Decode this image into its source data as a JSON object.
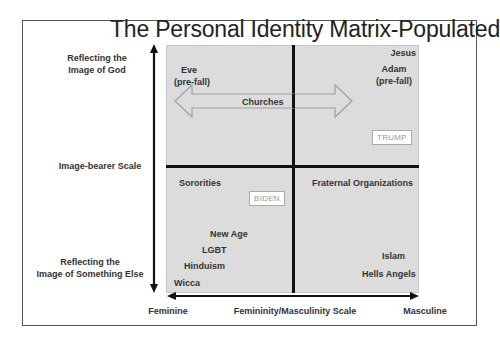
{
  "title": "The Personal Identity Matrix-Populated",
  "y_axis": {
    "top_label_line1": "Reflecting the",
    "top_label_line2": "Image of God",
    "middle_label": "Image-bearer Scale",
    "bottom_label_line1": "Reflecting the",
    "bottom_label_line2": "Image of Something Else"
  },
  "x_axis": {
    "left_label": "Feminine",
    "middle_label": "Femininity/Masculinity Scale",
    "right_label": "Masculine"
  },
  "quadrants": {
    "top_left": {
      "items": [
        {
          "line1": "Eve",
          "line2": "(pre-fall)"
        }
      ]
    },
    "top_right": {
      "items": [
        {
          "line1": "Jesus"
        },
        {
          "line1": "Adam",
          "line2": "(pre-fall)"
        }
      ],
      "tag": "TRUMP"
    },
    "bottom_left": {
      "items": [
        "Sororities",
        "New Age",
        "LGBT",
        "Hinduism",
        "Wicca"
      ],
      "tag": "BIDEN"
    },
    "bottom_right": {
      "items": [
        "Fraternal Organizations",
        "Islam",
        "Hells Angels"
      ]
    }
  },
  "spanning": {
    "churches": "Churches"
  },
  "colors": {
    "matrix_fill": "#dcdcdc",
    "divider": "#111111",
    "arrow_outline": "#a0a0a0",
    "text": "#333333"
  }
}
